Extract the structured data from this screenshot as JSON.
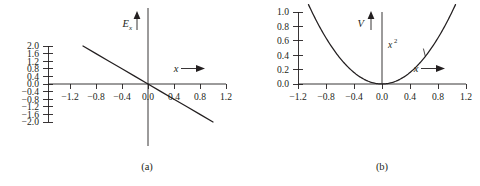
{
  "figure": {
    "background_color": "#ffffff",
    "ink_color": "#231f20",
    "width": 480,
    "height": 186,
    "panels": [
      {
        "id": "a",
        "caption": "(a)",
        "caption_x": 147,
        "caption_y": 161
      },
      {
        "id": "b",
        "caption": "(b)",
        "caption_x": 382,
        "caption_y": 161
      }
    ]
  },
  "chart_data": [
    {
      "type": "line",
      "panel": "a",
      "title": "",
      "xlabel": "x",
      "ylabel": "E_x",
      "ylabel_display": "E",
      "ylabel_subscript": "x",
      "xlim": [
        -1.2,
        1.2
      ],
      "ylim": [
        -2.0,
        2.0
      ],
      "grid": false,
      "legend": "none",
      "x_ticks": [
        -1.2,
        -0.8,
        -0.4,
        0.0,
        0.4,
        0.8,
        1.2
      ],
      "x_tick_labels": [
        "-1.2",
        "-0.8",
        "-0.4",
        "0.0",
        "0.4",
        "0.8",
        "1.2"
      ],
      "y_ticks": [
        -2.0,
        -1.6,
        -1.2,
        -0.8,
        -0.4,
        0.0,
        0.4,
        0.8,
        1.2,
        1.6,
        2.0
      ],
      "y_tick_labels": [
        "-2.0",
        "-1.6",
        "-1.2",
        "-0.8",
        "-0.4",
        "0.0",
        "0.4",
        "0.8",
        "1.2",
        "1.6",
        "2.0"
      ],
      "series": [
        {
          "name": "-2x",
          "slope": -2.0,
          "intercept": 0.0,
          "x": [
            -1.0,
            -0.8,
            -0.6,
            -0.4,
            -0.2,
            0.0,
            0.2,
            0.4,
            0.6,
            0.8,
            1.0
          ],
          "values": [
            2.0,
            1.6,
            1.2,
            0.8,
            0.4,
            0.0,
            -0.4,
            -0.8,
            -1.2,
            -1.6,
            -2.0
          ]
        }
      ],
      "annotations": []
    },
    {
      "type": "line",
      "panel": "b",
      "title": "",
      "xlabel": "x",
      "ylabel": "V",
      "ylabel_display": "V",
      "ylabel_subscript": "",
      "xlim": [
        -1.2,
        1.2
      ],
      "ylim": [
        0.0,
        1.0
      ],
      "grid": false,
      "legend": "none",
      "x_ticks": [
        -1.2,
        -0.8,
        -0.4,
        0.0,
        0.4,
        0.8,
        1.2
      ],
      "x_tick_labels": [
        "-1.2",
        "-0.8",
        "-0.4",
        "0.0",
        "0.4",
        "0.8",
        "1.2"
      ],
      "y_ticks": [
        0.0,
        0.2,
        0.4,
        0.6,
        0.8,
        1.0
      ],
      "y_tick_labels": [
        "0.0",
        "0.2",
        "0.4",
        "0.6",
        "0.8",
        "1.0"
      ],
      "series": [
        {
          "name": "x^2",
          "x": [
            -1.05,
            -0.9,
            -0.75,
            -0.6,
            -0.45,
            -0.3,
            -0.15,
            0.0,
            0.15,
            0.3,
            0.45,
            0.6,
            0.75,
            0.9,
            1.05
          ],
          "values": [
            1.1,
            0.81,
            0.5625,
            0.36,
            0.2025,
            0.09,
            0.0225,
            0.0,
            0.0225,
            0.09,
            0.2025,
            0.36,
            0.5625,
            0.81,
            1.1
          ]
        }
      ],
      "annotations": [
        {
          "text": "x²",
          "text_base": "x",
          "text_exp": "2",
          "at_x": 0.62,
          "at_y": 0.38,
          "label_x": 0.42,
          "label_y": 0.52
        }
      ]
    }
  ]
}
